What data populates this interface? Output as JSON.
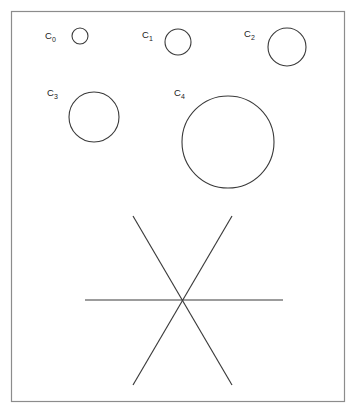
{
  "figure": {
    "background_color": "#ffffff",
    "stroke_color": "#3a3a3a",
    "frame_color": "#8c8c8c",
    "frame": {
      "x": 11,
      "y": 11,
      "width": 334,
      "height": 391
    },
    "circles": [
      {
        "id": "c0",
        "label_base": "C",
        "label_sub": "0",
        "cx": 80,
        "cy": 36,
        "r": 8,
        "label_x": 45,
        "label_y": 39
      },
      {
        "id": "c1",
        "label_base": "C",
        "label_sub": "1",
        "cx": 178,
        "cy": 42,
        "r": 13,
        "label_x": 142,
        "label_y": 38
      },
      {
        "id": "c2",
        "label_base": "C",
        "label_sub": "2",
        "cx": 287,
        "cy": 47,
        "r": 19,
        "label_x": 244,
        "label_y": 37
      },
      {
        "id": "c3",
        "label_base": "C",
        "label_sub": "3",
        "cx": 94,
        "cy": 117,
        "r": 25,
        "label_x": 47,
        "label_y": 96
      },
      {
        "id": "c4",
        "label_base": "C",
        "label_sub": "4",
        "cx": 228,
        "cy": 142,
        "r": 46,
        "label_x": 174,
        "label_y": 96
      }
    ],
    "asterisk": {
      "center_x": 183,
      "center_y": 300,
      "lines": [
        {
          "id": "line-horizontal",
          "x1": 85,
          "y1": 300,
          "x2": 283,
          "y2": 300
        },
        {
          "id": "line-diagonal-down",
          "x1": 133,
          "y1": 216,
          "x2": 232,
          "y2": 385
        },
        {
          "id": "line-diagonal-up",
          "x1": 232,
          "y1": 216,
          "x2": 133,
          "y2": 385
        }
      ]
    }
  }
}
